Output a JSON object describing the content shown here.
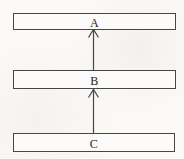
{
  "diagram": {
    "type": "flow-diagram",
    "orientation": "vertical",
    "nodes": [
      {
        "id": "A",
        "label": "A",
        "position": "top"
      },
      {
        "id": "B",
        "label": "B",
        "position": "middle"
      },
      {
        "id": "C",
        "label": "C",
        "position": "bottom"
      }
    ],
    "edges": [
      {
        "from": "B",
        "to": "A",
        "direction": "up",
        "style": "arrow"
      },
      {
        "from": "C",
        "to": "B",
        "direction": "up",
        "style": "arrow"
      }
    ],
    "colors": {
      "line": "#474747",
      "text": "#1c1c1c",
      "background": "#fbfaf7",
      "box_fill": "#fcfbf9"
    }
  }
}
